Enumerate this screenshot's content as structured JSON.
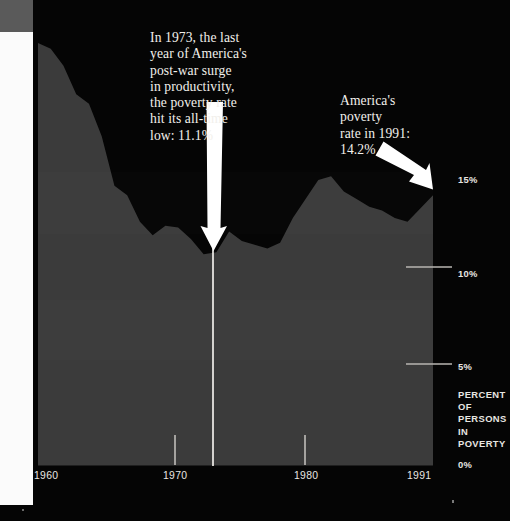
{
  "chart_data": {
    "type": "area",
    "title": "",
    "subtitle": "",
    "xlabel": "",
    "ylabel": "PERCENT OF PERSONS IN POVERTY",
    "xlim": [
      1960,
      1991
    ],
    "ylim": [
      0,
      16.5
    ],
    "grid": false,
    "legend_position": "none",
    "x_tick_labels": [
      "1960",
      "1970",
      "1980",
      "1991"
    ],
    "x_tick_values": [
      1960,
      1970,
      1980,
      1991
    ],
    "y_tick_labels": [
      "0%",
      "5%",
      "10%",
      "15%"
    ],
    "y_tick_values": [
      0,
      5,
      10,
      15
    ],
    "series": [
      {
        "name": "Percent of persons in poverty",
        "x": [
          1960,
          1961,
          1962,
          1963,
          1964,
          1965,
          1966,
          1967,
          1968,
          1969,
          1970,
          1971,
          1972,
          1973,
          1974,
          1975,
          1976,
          1977,
          1978,
          1979,
          1980,
          1981,
          1982,
          1983,
          1984,
          1985,
          1986,
          1987,
          1988,
          1989,
          1990,
          1991
        ],
        "values": [
          22.2,
          21.9,
          21.0,
          19.5,
          19.0,
          17.3,
          14.7,
          14.2,
          12.8,
          12.1,
          12.6,
          12.5,
          11.9,
          11.1,
          11.2,
          12.3,
          11.8,
          11.6,
          11.4,
          11.7,
          13.0,
          14.0,
          15.0,
          15.2,
          14.4,
          14.0,
          13.6,
          13.4,
          13.0,
          12.8,
          13.5,
          14.2
        ]
      }
    ],
    "annotations": [
      {
        "id": "low-1973",
        "text": "In 1973, the last year of America's post-war surge in productivity, the poverty rate hit its all-time low: 11.1%",
        "target_year": 1973,
        "target_value": 11.1
      },
      {
        "id": "rate-1991",
        "text": "America's poverty rate in 1991: 14.2%",
        "target_year": 1991,
        "target_value": 14.2
      }
    ],
    "marker_lines": [
      {
        "id": "year-1973-marker",
        "year": 1973
      }
    ],
    "colors": {
      "background": "#050505",
      "area_fill": "#3b3b3b",
      "annotation_text": "#f2f0ec",
      "axis_text": "#e8e6e2",
      "marker_line": "#f0eeea"
    }
  },
  "annotations": {
    "low_1973": "In 1973, the last\nyear of America's\npost-war surge\nin productivity,\nthe poverty rate\nhit its all-time\nlow: 11.1%",
    "rate_1991": "America's\npoverty\nrate in 1991:\n14.2%"
  },
  "axis": {
    "y_15": "15%",
    "y_10": "10%",
    "y_5": "5%",
    "y_0": "0%",
    "caption": "PERCENT\nOF\nPERSONS\nIN\nPOVERTY",
    "x_1960": "1960",
    "x_1970": "1970",
    "x_1980": "1980",
    "x_1991": "1991"
  }
}
